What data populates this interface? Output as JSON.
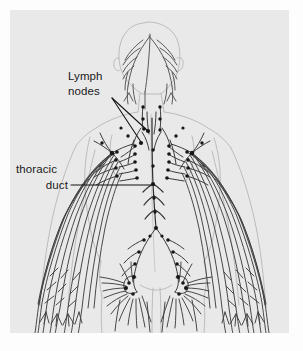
{
  "figure": {
    "name": "lymphatic-system-diagram",
    "view": "posterior full-body outline",
    "background_color": "#fdfdfd",
    "canvas_color": "#e9e9e9",
    "ink_color": "#3a3a3a",
    "node_color": "#1c1c1c",
    "width": 303,
    "height": 351
  },
  "labels": [
    {
      "id": "lymph-nodes",
      "line1": "Lymph",
      "line2": "nodes",
      "text_x": 68,
      "text_y": 80,
      "leaders": [
        {
          "x1": 112,
          "x2": 148,
          "y1": 98,
          "y2": 131
        },
        {
          "x1": 112,
          "x2": 141,
          "y1": 98,
          "y2": 142
        }
      ]
    },
    {
      "id": "thoracic-duct",
      "line1": "thoracic",
      "line2": "duct",
      "text_x": 16,
      "text_y": 173,
      "leaders": [
        {
          "x1": 71,
          "x2": 155,
          "y1": 185,
          "y2": 185
        }
      ]
    }
  ],
  "anatomy": {
    "regions": [
      "head-and-scalp",
      "neck",
      "shoulders",
      "thorax",
      "axillary",
      "arms",
      "abdomen",
      "pelvis",
      "inguinal",
      "legs"
    ],
    "node_count_visible": 58,
    "node_radius_px": 1.9
  },
  "colors": {
    "outline": "#9a9a9a",
    "vessel": "#3f3f3f",
    "node": "#141414",
    "label": "#1a1a1a",
    "canvas": "#e9e9e9",
    "page": "#fdfdfd"
  }
}
